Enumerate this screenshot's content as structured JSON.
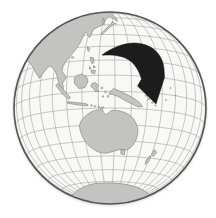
{
  "canvas": {
    "width": 216,
    "height": 218
  },
  "map": {
    "type": "orthographic-globe",
    "projection": {
      "center_lat": -10,
      "center_lon": 127,
      "grid_step_deg": 10,
      "sample_step_deg": 2,
      "cx": 110,
      "cy": 108,
      "radius": 96
    },
    "colors": {
      "background": "#ffffff",
      "ocean": "#f8f8f7",
      "graticule": "#9b9b9b",
      "land_fill": "#c3c3c2",
      "land_stroke": "#7f7f7f",
      "globe_outline": "#555555",
      "arrow": "#1c1c1c"
    },
    "stroke_widths": {
      "graticule": 0.55,
      "land": 0.6,
      "outline": 1.6
    },
    "landmasses": [
      {
        "name": "asia-mainland",
        "path": "M 10 95 L 8 8 L 98 4 L 104 10 L 109 12 C 113 13.5 116 17 117.5 21.5 L 113.5 18.5 L 109.5 16 L 106 19 L 104 23 L 101.5 25.5 L 97 27.5 L 93.5 29.5 L 92 32.5 L 91 35.5 L 89.5 37.5 L 87.5 34.5 L 85.5 31.5 L 83 37 L 80 43 L 76.5 48.5 L 72.5 53.5 L 69 57.5 L 65.5 62 L 63 66.5 L 62 71 L 64.5 74.5 L 66.5 77 L 64.5 80 L 62.5 83.5 L 63.5 87.5 L 63 90.5 L 60.5 87 L 58.5 82.5 L 57.5 78 L 56 73 L 53 68 L 49.5 66 L 46 69.5 L 42.5 74 L 39.5 78.5 L 36 73 L 32.5 66.5 L 28 61 L 22 57.5 L 14 57 Z"
      },
      {
        "name": "arabia-limb-strip",
        "path": "M 10 60 L 14.5 62 L 16.5 70 L 15.5 80 L 16.5 90 L 12 95 Z"
      },
      {
        "name": "sakhalin",
        "path": "M 103 18 L 104.6 21 L 104 25 L 102.5 21.5 Z"
      },
      {
        "name": "japan",
        "path": "M 112.5 21.5 L 114.5 23.5 L 112.5 25.5 L 110 27 L 108 29 L 106 31 L 104 32.5 L 102.5 34.5 L 101 33.5 L 103 31.5 L 105 29.5 L 107 27.5 L 109 25.5 L 111 23.5 Z"
      },
      {
        "name": "taiwan",
        "path": "M 87.5 47 L 89.5 48 L 89 51.5 L 87.3 50 Z"
      },
      {
        "name": "philippines",
        "path": "M 90.5 57 L 93.5 58 L 94 61.5 L 92.5 64 L 90.5 60.5 Z M 93.5 65.5 L 95.5 67 L 93.5 68 Z M 89.5 66.5 L 91 68.5 L 89.5 69.5 Z M 91.5 70 L 95.5 70.5 L 94.5 74 L 91 72.5 Z"
      },
      {
        "name": "borneo",
        "path": "M 76 76 L 81.5 74 L 86.5 76.5 L 88 81.5 L 85 87.5 L 79 88.5 L 74.5 83.5 L 74.2 78.5 Z"
      },
      {
        "name": "sumatra",
        "path": "M 57.5 83.5 L 61.5 87.5 L 66.5 93 L 70.5 97.5 L 68.5 99.5 L 63.5 95 L 58.8 89.5 L 55.8 85.5 Z"
      },
      {
        "name": "java",
        "path": "M 67 101.5 L 76 102.5 L 85 103.5 L 88 104.5 L 87.5 106 L 77 104.8 L 67.5 103.2 Z"
      },
      {
        "name": "sulawesi",
        "path": "M 92 83.5 L 95.5 82.5 L 98.5 85.5 L 96.5 88 L 99 91.5 L 95.5 91.8 L 93.5 88.5 L 90.8 86.5 Z"
      },
      {
        "name": "new-guinea",
        "path": "M 109.5 92.5 L 113.5 88.5 L 117 90 L 122 92 L 128 95 L 134 98.5 L 139.5 102.5 L 142.5 106.5 L 138.5 107 L 132 104 L 125 100.5 L 118 96.5 L 112.5 94.5 L 108.8 94 Z"
      },
      {
        "name": "australia",
        "path": "M 88 114 C 92 110.5 97 109.5 100 110.2 L 101.5 107 C 102.5 109.5 103.2 112 104.8 114 C 106.5 115.5 108.5 112.5 111 110.8 C 115.5 109.3 121.5 111 127 113.5 C 132.5 116.2 136 121.5 137.6 127.5 C 138.6 133.5 136.8 139.5 133.5 144.2 C 131 148 127.5 150.8 123 149.8 C 118.5 149 113.5 151.5 107.5 153 C 101 154 95 151 89.5 146.2 C 84.5 141.5 80.5 134.5 79.6 127.5 C 79 121.5 83.5 117.3 88 114 Z"
      },
      {
        "name": "tasmania",
        "path": "M 121 149.5 L 125 150 L 124.3 154.8 L 120.8 153.8 Z"
      },
      {
        "name": "new-zealand",
        "path": "M 154.5 149.5 L 156.8 152.5 L 153.2 156.5 L 151.5 154.5 Z M 151 156.5 L 148.5 161.5 L 145 164.5 L 146 160.5 L 149.5 156 Z"
      },
      {
        "name": "antarctica",
        "path": "M 66 203 C 72 193 82 185.5 95 183.5 C 110 181.8 128 183.5 139 188 C 148 192 154 198 157 205 L 155 215 L 68 215 Z"
      }
    ],
    "island_dots": [
      [
        128,
        13,
        0.8
      ],
      [
        133,
        14.5,
        0.8
      ],
      [
        138,
        17,
        0.8
      ],
      [
        115.5,
        23.8,
        0.7
      ],
      [
        72.5,
        57.5,
        1.1
      ],
      [
        91.5,
        105.5,
        0.9
      ],
      [
        95,
        106.3,
        0.9
      ],
      [
        99,
        107,
        0.9
      ],
      [
        103,
        107.5,
        0.9
      ],
      [
        102,
        88,
        1.0
      ],
      [
        105.5,
        92,
        1.1
      ],
      [
        103,
        96.5,
        0.9
      ],
      [
        108,
        96.3,
        1.0
      ],
      [
        146,
        95.5,
        0.9
      ],
      [
        149,
        99,
        1.0
      ],
      [
        152.5,
        102.5,
        0.9
      ],
      [
        155.5,
        105.5,
        0.8
      ],
      [
        170.5,
        88,
        0.7
      ],
      [
        175.5,
        95.5,
        0.7
      ],
      [
        166,
        100,
        0.7
      ]
    ],
    "annotations": [
      {
        "name": "curved-arrow",
        "description": "thick black swoosh arrow curving from northwest Pacific southeastward, arrowhead pointing down",
        "path": "M 102 55 C 112 47.5 124 43 134 43 C 144 43 153 47 158 53.5 C 162.5 59 164 65.5 164.2 71.5 L 164.5 77.5 L 156 104 L 137.5 86 L 141.5 79 C 139.5 72.5 136.5 66.5 131.5 61.8 C 124 55.5 112 54.5 103.5 55.2 Z"
      }
    ]
  }
}
